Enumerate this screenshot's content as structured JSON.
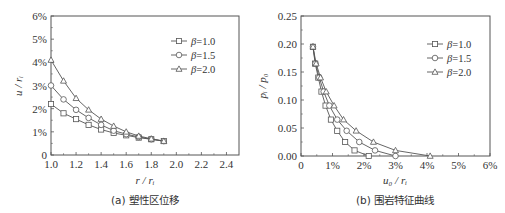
{
  "chart_data": [
    {
      "type": "line",
      "title": "",
      "caption": "(a) 塑性区位移",
      "xlabel": "r / r_i",
      "ylabel": "u / r_i",
      "xlim": [
        1.0,
        2.5
      ],
      "ylim": [
        0,
        6
      ],
      "x_ticks": [
        "1.0",
        "1.2",
        "1.4",
        "1.6",
        "1.8",
        "2.0",
        "2.2",
        "2.4"
      ],
      "y_ticks": [
        "0",
        "1%",
        "2%",
        "3%",
        "4%",
        "5%",
        "6%"
      ],
      "legend_position": "upper right",
      "grid": false,
      "x": [
        1.0,
        1.1,
        1.2,
        1.3,
        1.4,
        1.5,
        1.6,
        1.7,
        1.8,
        1.9
      ],
      "series": [
        {
          "name": "β=1.0",
          "marker": "square",
          "values": [
            2.2,
            1.8,
            1.55,
            1.3,
            1.1,
            0.95,
            0.85,
            0.75,
            0.68,
            0.6
          ]
        },
        {
          "name": "β=1.5",
          "marker": "circle",
          "values": [
            3.0,
            2.4,
            1.95,
            1.6,
            1.3,
            1.05,
            0.9,
            0.78,
            0.68,
            0.6
          ]
        },
        {
          "name": "β=2.0",
          "marker": "triangle",
          "values": [
            4.1,
            3.2,
            2.45,
            1.95,
            1.55,
            1.25,
            1.0,
            0.82,
            0.7,
            0.6
          ]
        }
      ]
    },
    {
      "type": "line",
      "title": "",
      "caption": "(b) 围岩特征曲线",
      "xlabel": "u_0 / r_i",
      "ylabel": "p_i / p_0",
      "xlim": [
        0,
        6
      ],
      "ylim": [
        0,
        0.25
      ],
      "x_ticks": [
        "0",
        "1%",
        "2%",
        "3%",
        "4%",
        "5%",
        "6%"
      ],
      "y_ticks": [
        "0.00",
        "0.05",
        "0.10",
        "0.15",
        "0.20",
        "0.25"
      ],
      "legend_position": "upper right",
      "grid": false,
      "series": [
        {
          "name": "β=1.0",
          "marker": "square",
          "x": [
            0.38,
            0.45,
            0.55,
            0.65,
            0.78,
            0.95,
            1.15,
            1.4,
            1.7,
            2.15
          ],
          "values": [
            0.195,
            0.165,
            0.14,
            0.115,
            0.09,
            0.065,
            0.045,
            0.025,
            0.01,
            0.0
          ]
        },
        {
          "name": "β=1.5",
          "marker": "circle",
          "x": [
            0.38,
            0.46,
            0.58,
            0.72,
            0.9,
            1.15,
            1.45,
            1.85,
            2.35,
            3.0
          ],
          "values": [
            0.195,
            0.165,
            0.14,
            0.115,
            0.09,
            0.065,
            0.045,
            0.025,
            0.01,
            0.0
          ]
        },
        {
          "name": "β=2.0",
          "marker": "triangle",
          "x": [
            0.38,
            0.48,
            0.62,
            0.8,
            1.05,
            1.35,
            1.75,
            2.3,
            3.0,
            4.1
          ],
          "values": [
            0.195,
            0.165,
            0.14,
            0.115,
            0.09,
            0.065,
            0.045,
            0.025,
            0.01,
            0.0
          ]
        }
      ]
    }
  ]
}
